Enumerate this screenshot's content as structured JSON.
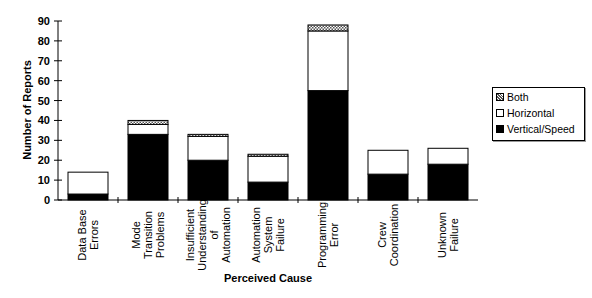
{
  "chart_data": {
    "type": "bar",
    "stacked": true,
    "title": "",
    "xlabel": "Perceived Cause",
    "ylabel": "Number of Reports",
    "ylim": [
      0,
      90
    ],
    "yticks": [
      0,
      10,
      20,
      30,
      40,
      50,
      60,
      70,
      80,
      90
    ],
    "grid": false,
    "legend_position": "right",
    "categories": [
      [
        "Data Base",
        "Errors"
      ],
      [
        "Mode",
        "Transition",
        "Problems"
      ],
      [
        "Insufficient",
        "Understanding",
        "of",
        "Automation"
      ],
      [
        "Automation",
        "System",
        "Failure"
      ],
      [
        "Programming",
        "Error"
      ],
      [
        "Crew",
        "Coordination"
      ],
      [
        "Unknown",
        "Failure"
      ]
    ],
    "series": [
      {
        "name": "Vertical/Speed",
        "values": [
          3,
          33,
          20,
          9,
          55,
          13,
          18
        ],
        "fill": "#000000"
      },
      {
        "name": "Horizontal",
        "values": [
          11,
          5,
          12,
          13,
          30,
          12,
          8
        ],
        "fill": "#ffffff"
      },
      {
        "name": "Both",
        "values": [
          0,
          2,
          1,
          1,
          3,
          0,
          0
        ],
        "fill": "hatch"
      }
    ],
    "legend": [
      "Both",
      "Horizontal",
      "Vertical/Speed"
    ]
  }
}
